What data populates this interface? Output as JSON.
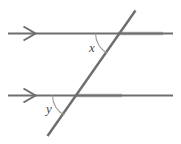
{
  "diagram": {
    "background_color": "#ffffff",
    "line_color": "#6e6e6e",
    "line_color_light": "#a8a8a8",
    "arc_color": "#8c8c8c",
    "label_color": "#4a4a4a",
    "stroke_width": 2.2,
    "arc_stroke_width": 1.1
  },
  "labels": {
    "angle_x": "x",
    "angle_y": "y"
  },
  "elements": {
    "top_parallel_line": {
      "name": "top-parallel-line",
      "x1": 8,
      "y1": 33.5,
      "x2": 173,
      "y2": 33.5,
      "marker": "single-arrowhead"
    },
    "bottom_parallel_line": {
      "name": "bottom-parallel-line",
      "x1": 8,
      "y1": 95.5,
      "x2": 173,
      "y2": 95.5,
      "marker": "single-arrowhead"
    },
    "transversal_line": {
      "name": "transversal-line",
      "x1": 135,
      "y1": 11,
      "x2": 48,
      "y2": 136
    },
    "top_arrowhead": {
      "name": "top-arrowhead-icon",
      "tip_x": 35,
      "tip_y": 33.5,
      "back_x": 23,
      "half_height": 7
    },
    "bottom_arrowhead": {
      "name": "bottom-arrowhead-icon",
      "tip_x": 35,
      "tip_y": 95.5,
      "back_x": 23,
      "half_height": 7
    },
    "angle_x_arc": {
      "name": "angle-x-arc",
      "vertex_x": 118,
      "vertex_y": 33.5,
      "radius": 23,
      "path": "M 95 33.5 A 23 23 0 0 0 107.9 53.9"
    },
    "angle_y_arc": {
      "name": "angle-y-arc",
      "vertex_x": 75,
      "vertex_y": 95.5,
      "radius": 23,
      "path": "M 52 95.5 A 23 23 0 0 0 64.9 115.9"
    },
    "angle_x_label_pos": {
      "x": 92,
      "y": 52
    },
    "angle_y_label_pos": {
      "x": 49,
      "y": 113
    }
  }
}
